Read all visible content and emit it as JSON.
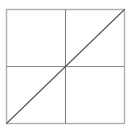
{
  "figure": {
    "title": "Square divided into four quadrants with a diagonal",
    "canvas": {
      "width": 134,
      "height": 132,
      "background_color": "#ffffff"
    },
    "square": {
      "name": "outer square",
      "x": 6.5,
      "y": 9.5,
      "width": 118,
      "height": 114,
      "stroke_color": "#b0b0b0",
      "stroke_width": 1.4,
      "fill_color": "#ffffff"
    },
    "vertical_midline": {
      "name": "vertical midline",
      "x1": 65.5,
      "y1": 9.5,
      "x2": 65.5,
      "y2": 123.5,
      "stroke_color": "#7a7a7a",
      "stroke_width": 1
    },
    "horizontal_midline": {
      "name": "horizontal midline",
      "x1": 6.5,
      "y1": 66.5,
      "x2": 124.5,
      "y2": 66.5,
      "stroke_color": "#8a8a8a",
      "stroke_width": 1
    },
    "diagonal": {
      "name": "diagonal from bottom-left to top-right",
      "x1": 6.5,
      "y1": 123.5,
      "x2": 124.5,
      "y2": 9.5,
      "stroke_color": "#555555",
      "stroke_width": 1.1
    },
    "labels": {
      "caption": "",
      "quadrant_top_left": "",
      "quadrant_top_right": "",
      "quadrant_bottom_left": "",
      "quadrant_bottom_right": ""
    }
  }
}
